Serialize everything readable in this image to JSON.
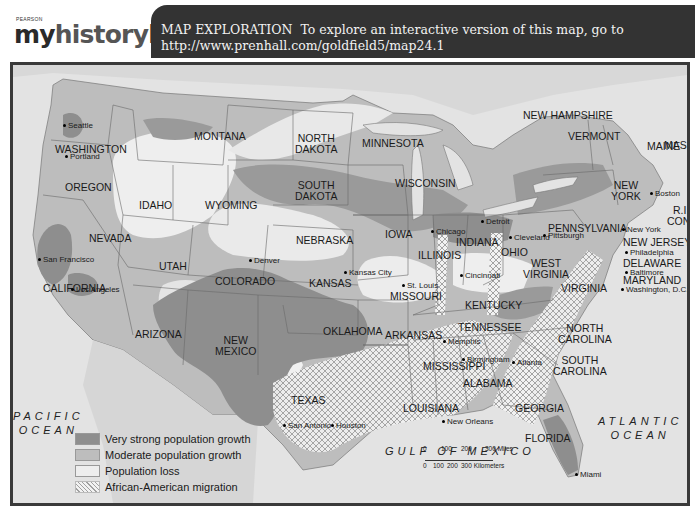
{
  "header": {
    "logo_publisher": "PEARSON",
    "logo_part1": "my",
    "logo_part2": "history",
    "logo_part3": "lab",
    "banner_title": "MAP EXPLORATION",
    "banner_text": "To explore an interactive version of this map, go to",
    "banner_url": "http://www.prenhall.com/goldfield5/map24.1"
  },
  "colors": {
    "very_strong": "#8e8e8e",
    "moderate": "#b9b9b9",
    "loss": "#eeeeee",
    "water": "#e3e3e3",
    "banner": "#333333",
    "frame": "#3a3a3a"
  },
  "map": {
    "states": [
      {
        "name": "WASHINGTON",
        "x": 42,
        "y": 82
      },
      {
        "name": "OREGON",
        "x": 52,
        "y": 125
      },
      {
        "name": "CALIFORNIA",
        "x": 30,
        "y": 218
      },
      {
        "name": "NEVADA",
        "x": 76,
        "y": 168
      },
      {
        "name": "IDAHO",
        "x": 126,
        "y": 146
      },
      {
        "name": "MONTANA",
        "x": 180,
        "y": 72
      },
      {
        "name": "WYOMING",
        "x": 192,
        "y": 138
      },
      {
        "name": "UTAH",
        "x": 146,
        "y": 195
      },
      {
        "name": "COLORADO",
        "x": 200,
        "y": 203
      },
      {
        "name": "ARIZONA",
        "x": 122,
        "y": 261
      },
      {
        "name": "NEW\nMEXICO",
        "x": 202,
        "y": 272
      },
      {
        "name": "NORTH\nDAKOTA",
        "x": 280,
        "y": 71
      },
      {
        "name": "SOUTH\nDAKOTA",
        "x": 280,
        "y": 120
      },
      {
        "name": "NEBRASKA",
        "x": 278,
        "y": 172
      },
      {
        "name": "KANSAS",
        "x": 295,
        "y": 212
      },
      {
        "name": "OKLAHOMA",
        "x": 310,
        "y": 263
      },
      {
        "name": "TEXAS",
        "x": 275,
        "y": 327
      },
      {
        "name": "MINNESOTA",
        "x": 342,
        "y": 74
      },
      {
        "name": "IOWA",
        "x": 365,
        "y": 164
      },
      {
        "name": "MISSOURI",
        "x": 375,
        "y": 224
      },
      {
        "name": "ARKANSAS",
        "x": 373,
        "y": 262
      },
      {
        "name": "LOUISIANA",
        "x": 392,
        "y": 345
      },
      {
        "name": "WISCONSIN",
        "x": 378,
        "y": 113
      },
      {
        "name": "ILLINOIS",
        "x": 402,
        "y": 187
      },
      {
        "name": "INDIANA",
        "x": 442,
        "y": 173
      },
      {
        "name": "OHIO",
        "x": 487,
        "y": 180
      },
      {
        "name": "MICHIGAN",
        "x": 0,
        "y": 0,
        "hidden": true
      },
      {
        "name": "KENTUCKY",
        "x": 452,
        "y": 233
      },
      {
        "name": "TENNESSEE",
        "x": 443,
        "y": 252
      },
      {
        "name": "MISSISSIPPI",
        "x": 408,
        "y": 296
      },
      {
        "name": "ALABAMA",
        "x": 450,
        "y": 310
      },
      {
        "name": "GEORGIA",
        "x": 492,
        "y": 334
      },
      {
        "name": "FLORIDA",
        "x": 508,
        "y": 366
      },
      {
        "name": "SOUTH\nCAROLINA",
        "x": 530,
        "y": 290
      },
      {
        "name": "NORTH\nCAROLINA",
        "x": 540,
        "y": 257
      },
      {
        "name": "VIRGINIA",
        "x": 540,
        "y": 216
      },
      {
        "name": "WEST\nVIRGINIA",
        "x": 505,
        "y": 194
      },
      {
        "name": "PENNSYLVANIA",
        "x": 530,
        "y": 160
      },
      {
        "name": "NEW\nYORK",
        "x": 582,
        "y": 118
      },
      {
        "name": "NEW JERSEY",
        "x": 600,
        "y": 171
      },
      {
        "name": "DELAWARE",
        "x": 597,
        "y": 197
      },
      {
        "name": "MARYLAND",
        "x": 597,
        "y": 213
      },
      {
        "name": "VERMONT",
        "x": 545,
        "y": 56
      },
      {
        "name": "NEW HAMPSHIRE",
        "x": 503,
        "y": 40
      },
      {
        "name": "MAINE",
        "x": 625,
        "y": 75
      },
      {
        "name": "MASS.",
        "x": 641,
        "y": 96
      },
      {
        "name": "R.I.",
        "x": 653,
        "y": 122
      },
      {
        "name": "CONN.",
        "x": 647,
        "y": 133
      }
    ],
    "cities": [
      {
        "name": "Seattle",
        "x": 50,
        "y": 55
      },
      {
        "name": "Portland",
        "x": 52,
        "y": 65
      },
      {
        "name": "San Francisco",
        "x": 26,
        "y": 190
      },
      {
        "name": "Los Angeles",
        "x": 57,
        "y": 224
      },
      {
        "name": "Denver",
        "x": 234,
        "y": 190
      },
      {
        "name": "Kansas City",
        "x": 330,
        "y": 204
      },
      {
        "name": "St. Louis",
        "x": 376,
        "y": 219
      },
      {
        "name": "Chicago",
        "x": 413,
        "y": 160
      },
      {
        "name": "Detroit",
        "x": 470,
        "y": 151
      },
      {
        "name": "Cleveland",
        "x": 494,
        "y": 164
      },
      {
        "name": "Pittsburgh",
        "x": 526,
        "y": 165
      },
      {
        "name": "Cincinnati",
        "x": 446,
        "y": 205
      },
      {
        "name": "Memphis",
        "x": 418,
        "y": 264
      },
      {
        "name": "Birmingham",
        "x": 450,
        "y": 282
      },
      {
        "name": "Atlanta",
        "x": 497,
        "y": 285
      },
      {
        "name": "New Orleans",
        "x": 430,
        "y": 355
      },
      {
        "name": "San Antonio",
        "x": 269,
        "y": 356
      },
      {
        "name": "Houston",
        "x": 314,
        "y": 356
      },
      {
        "name": "Miami",
        "x": 565,
        "y": 402
      },
      {
        "name": "Boston",
        "x": 642,
        "y": 107
      },
      {
        "name": "New York",
        "x": 618,
        "y": 154
      },
      {
        "name": "Philadelphia",
        "x": 614,
        "y": 178
      },
      {
        "name": "Baltimore",
        "x": 614,
        "y": 205
      },
      {
        "name": "Washington, D.C.",
        "x": 612,
        "y": 221
      }
    ],
    "oceans": [
      {
        "name": "PACIFIC\nOCEAN",
        "x": 0,
        "y": 344
      },
      {
        "name": "ATLANTIC\nOCEAN",
        "x": 588,
        "y": 358
      },
      {
        "name": "GULF OF MEXICO",
        "x": 372,
        "y": 378
      }
    ]
  },
  "legend": {
    "items": [
      {
        "label": "Very strong population growth",
        "swatch": "very_strong"
      },
      {
        "label": "Moderate population growth",
        "swatch": "moderate"
      },
      {
        "label": "Population loss",
        "swatch": "loss"
      },
      {
        "label": "African-American migration",
        "swatch": "migration"
      }
    ]
  },
  "scale": {
    "miles_ticks": [
      "0",
      "100",
      "200",
      "300 Miles"
    ],
    "km_ticks": [
      "0",
      "100",
      "200",
      "300 Kilometers"
    ]
  }
}
